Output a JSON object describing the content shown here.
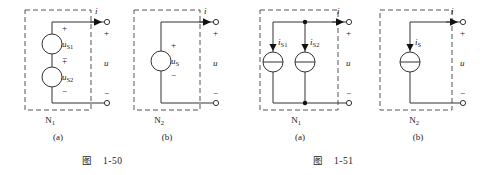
{
  "figures": [
    {
      "id": "fig-1-50",
      "caption": "图　1-50",
      "panels": [
        {
          "key": "a",
          "label": "(a)",
          "network_label": "N",
          "network_sub": "1",
          "current_label": "i",
          "voltage_label": "u",
          "terminal_plus": "+",
          "terminal_minus": "−",
          "sources": [
            {
              "name": "u",
              "sub": "S1",
              "plus": "+",
              "minus": "−",
              "type": "voltage-source"
            },
            {
              "name": "u",
              "sub": "S2",
              "plus": "+",
              "minus": "−",
              "type": "voltage-source"
            }
          ]
        },
        {
          "key": "b",
          "label": "(b)",
          "network_label": "N",
          "network_sub": "2",
          "current_label": "i",
          "voltage_label": "u",
          "terminal_plus": "+",
          "terminal_minus": "−",
          "sources": [
            {
              "name": "u",
              "sub": "S",
              "plus": "+",
              "minus": "−",
              "type": "voltage-source"
            }
          ]
        }
      ]
    },
    {
      "id": "fig-1-51",
      "caption": "图　1-51",
      "panels": [
        {
          "key": "a",
          "label": "(a)",
          "network_label": "N",
          "network_sub": "1",
          "current_label": "i",
          "voltage_label": "u",
          "terminal_plus": "+",
          "terminal_minus": "−",
          "sources": [
            {
              "name": "i",
              "sub": "S1",
              "type": "current-source"
            },
            {
              "name": "i",
              "sub": "S2",
              "type": "current-source"
            }
          ]
        },
        {
          "key": "b",
          "label": "(b)",
          "network_label": "N",
          "network_sub": "2",
          "current_label": "i",
          "voltage_label": "u",
          "terminal_plus": "+",
          "terminal_minus": "−",
          "sources": [
            {
              "name": "i",
              "sub": "S",
              "type": "current-source"
            }
          ]
        }
      ]
    }
  ]
}
